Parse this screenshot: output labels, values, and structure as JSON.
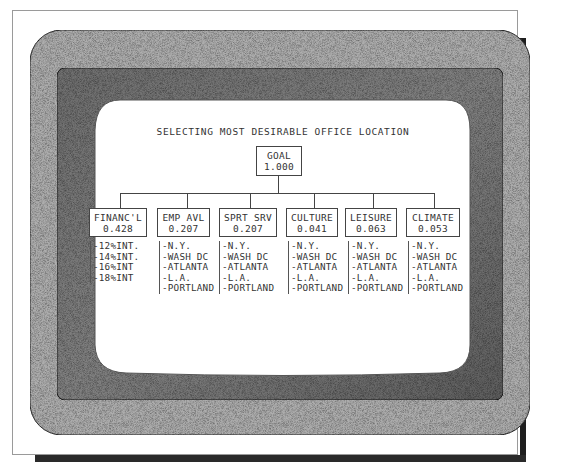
{
  "diagram": {
    "title": "SELECTING MOST DESIRABLE OFFICE LOCATION",
    "goal": {
      "label": "GOAL",
      "weight": "1.000"
    },
    "criteria": [
      {
        "label": "FINANC'L",
        "weight": "0.428",
        "alternatives": [
          "-12%INT.",
          "-14%INT.",
          "-16%INT",
          "-18%INT"
        ]
      },
      {
        "label": "EMP AVL",
        "weight": "0.207",
        "alternatives": [
          "-N.Y.",
          "-WASH DC",
          "-ATLANTA",
          "-L.A.",
          "-PORTLAND"
        ]
      },
      {
        "label": "SPRT SRV",
        "weight": "0.207",
        "alternatives": [
          "-N.Y.",
          "-WASH DC",
          "-ATLANTA",
          "-L.A.",
          "-PORTLAND"
        ]
      },
      {
        "label": "CULTURE",
        "weight": "0.041",
        "alternatives": [
          "-N.Y.",
          "-WASH DC",
          "-ATLANTA",
          "-L.A.",
          "-PORTLAND"
        ]
      },
      {
        "label": "LEISURE",
        "weight": "0.063",
        "alternatives": [
          "-N.Y.",
          "-WASH DC",
          "-ATLANTA",
          "-L.A.",
          "-PORTLAND"
        ]
      },
      {
        "label": "CLIMATE",
        "weight": "0.053",
        "alternatives": [
          "-N.Y.",
          "-WASH DC",
          "-ATLANTA",
          "-L.A.",
          "-PORTLAND"
        ]
      }
    ]
  },
  "colors": {
    "outer_bezel": "#a8a8a8",
    "inner_bezel": "#7a7a7a",
    "screen": "#ffffff",
    "ink": "#333333",
    "shadow": "#1e1e1e"
  }
}
